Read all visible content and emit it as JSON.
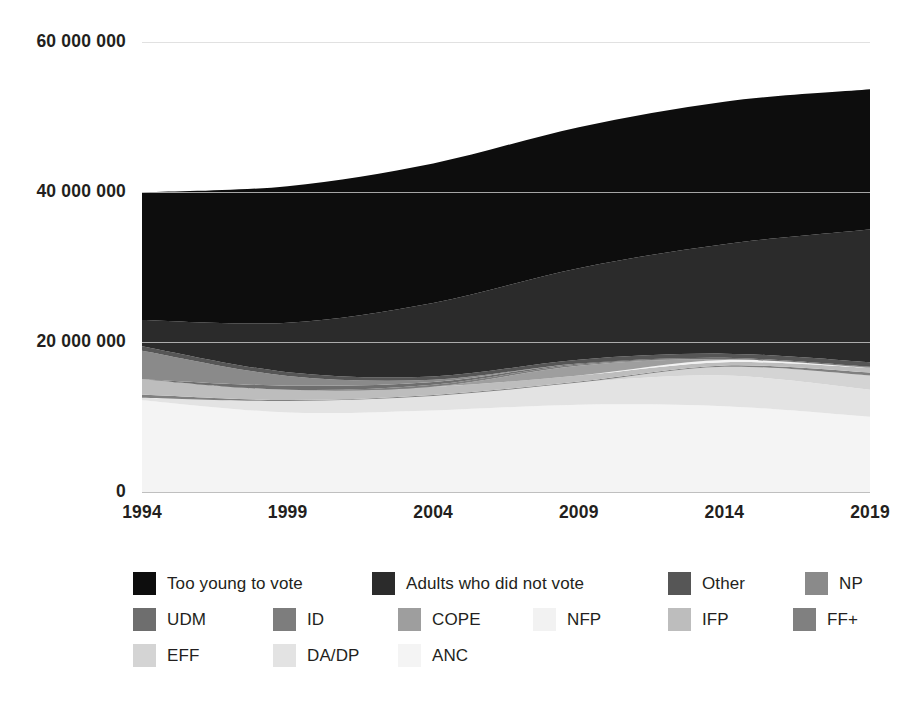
{
  "chart_data": {
    "type": "area",
    "stacked": true,
    "title": "",
    "subtitle": "",
    "xlabel": "",
    "ylabel": "",
    "x": [
      1994,
      1999,
      2004,
      2009,
      2014,
      2019
    ],
    "xlim": [
      1994,
      2019
    ],
    "ylim": [
      0,
      60000000
    ],
    "y_ticks": [
      0,
      20000000,
      40000000,
      60000000
    ],
    "y_tick_labels": [
      "0",
      "20 000 000",
      "40 000 000",
      "60 000 000"
    ],
    "x_tick_labels": [
      "1994",
      "1999",
      "2004",
      "2009",
      "2014",
      "2019"
    ],
    "grid": true,
    "grid_axis": "y",
    "legend_position": "bottom",
    "legend_columns": 6,
    "stack_order_bottom_to_top": [
      "ANC",
      "DA/DP",
      "EFF",
      "FF+",
      "IFP",
      "NFP",
      "COPE",
      "ID",
      "UDM",
      "NP",
      "Other",
      "Adults who did not vote",
      "Too young to vote"
    ],
    "series": [
      {
        "name": "Too young to vote",
        "color": "#0d0d0d",
        "values": [
          17000000,
          18200000,
          18600000,
          18800000,
          19000000,
          18700000
        ]
      },
      {
        "name": "Adults who did not vote",
        "color": "#2b2b2b",
        "values": [
          3500000,
          6600000,
          9800000,
          12200000,
          14600000,
          17700000
        ]
      },
      {
        "name": "Other",
        "color": "#565656",
        "values": [
          600000,
          500000,
          450000,
          500000,
          550000,
          600000
        ]
      },
      {
        "name": "NP",
        "color": "#8a8a8a",
        "values": [
          3800000,
          1300000,
          300000,
          0,
          0,
          0
        ]
      },
      {
        "name": "UDM",
        "color": "#6e6e6e",
        "values": [
          0,
          550000,
          350000,
          150000,
          180000,
          80000
        ]
      },
      {
        "name": "ID",
        "color": "#7d7d7d",
        "values": [
          0,
          0,
          270000,
          160000,
          0,
          0
        ]
      },
      {
        "name": "COPE",
        "color": "#9e9e9e",
        "values": [
          0,
          0,
          0,
          1300000,
          120000,
          50000
        ]
      },
      {
        "name": "NFP",
        "color": "#f2f2f2",
        "values": [
          0,
          0,
          0,
          0,
          290000,
          30000
        ]
      },
      {
        "name": "IFP",
        "color": "#bdbdbd",
        "values": [
          2050000,
          1370000,
          1090000,
          800000,
          440000,
          590000
        ]
      },
      {
        "name": "FF+",
        "color": "#808080",
        "values": [
          420000,
          130000,
          140000,
          150000,
          170000,
          410000
        ]
      },
      {
        "name": "EFF",
        "color": "#d4d4d4",
        "values": [
          0,
          0,
          0,
          0,
          1170000,
          1880000
        ]
      },
      {
        "name": "DA/DP",
        "color": "#e3e3e3",
        "values": [
          340000,
          1530000,
          1930000,
          2940000,
          4090000,
          3620000
        ]
      },
      {
        "name": "ANC",
        "color": "#f4f4f4",
        "values": [
          12240000,
          10600000,
          10880000,
          11650000,
          11440000,
          10030000
        ]
      }
    ],
    "totals": [
      40000000,
      41000000,
      44000000,
      49000000,
      52000000,
      58700000
    ]
  },
  "legend": {
    "rows": [
      [
        {
          "label": "Too young to vote",
          "color": "#0d0d0d"
        },
        {
          "label": "Adults who did not vote",
          "color": "#2b2b2b"
        },
        {
          "label": "Other",
          "color": "#565656"
        },
        {
          "label": "NP",
          "color": "#8a8a8a"
        }
      ],
      [
        {
          "label": "UDM",
          "color": "#6e6e6e"
        },
        {
          "label": "ID",
          "color": "#7d7d7d"
        },
        {
          "label": "COPE",
          "color": "#9e9e9e"
        },
        {
          "label": "NFP",
          "color": "#f2f2f2"
        },
        {
          "label": "IFP",
          "color": "#bdbdbd"
        },
        {
          "label": "FF+",
          "color": "#808080"
        }
      ],
      [
        {
          "label": "EFF",
          "color": "#d4d4d4"
        },
        {
          "label": "DA/DP",
          "color": "#e3e3e3"
        },
        {
          "label": "ANC",
          "color": "#f4f4f4"
        }
      ]
    ]
  },
  "colors": {
    "axis_text": "#231f20",
    "gridline": "#d8d8d8",
    "background": "#ffffff"
  }
}
